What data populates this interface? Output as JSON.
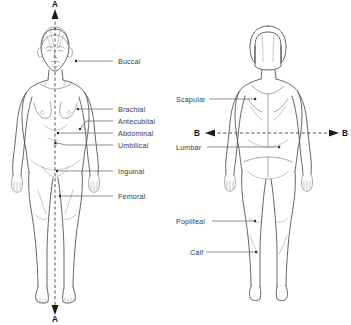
{
  "diagram": {
    "background_color": "#ffffff",
    "line_color": "#4a4a4a",
    "label_color": "#3a3a3a",
    "plane_color": "#2f2f2f"
  },
  "planes": [
    {
      "id": "plane-a",
      "letter_top": "A",
      "letter_bottom": "A",
      "orientation": "vertical",
      "description": "midsagittal plane on anterior figure"
    },
    {
      "id": "plane-b",
      "letter_left": "B",
      "letter_right": "B",
      "orientation": "horizontal",
      "description": "transverse plane on posterior figure"
    }
  ],
  "anterior": {
    "view_name": "anterior-view",
    "labels": [
      {
        "text": "Buccal",
        "x": 118,
        "y": 64,
        "line_x1": 113,
        "line_x2": 78,
        "dot_x": 76,
        "dot_y": 61
      },
      {
        "text": "Brachial",
        "x": 118,
        "y": 112,
        "line_x1": 113,
        "line_x2": 80,
        "dot_x": 78,
        "dot_y": 109
      },
      {
        "text": "Antecubital",
        "x": 118,
        "y": 124,
        "line_x1": 113,
        "line_x2": 82,
        "dot_x": 80,
        "dot_y": 128
      },
      {
        "text": "Abdominal",
        "x": 118,
        "y": 136,
        "line_x1": 113,
        "line_x2": 60,
        "dot_x": 58,
        "dot_y": 133
      },
      {
        "text": "Umbilical",
        "x": 118,
        "y": 148,
        "line_x1": 113,
        "line_x2": 62,
        "dot_x": 60,
        "dot_y": 143
      },
      {
        "text": "Inguinal",
        "x": 118,
        "y": 174,
        "line_x1": 113,
        "line_x2": 59,
        "dot_x": 57,
        "dot_y": 172
      },
      {
        "text": "Femoral",
        "x": 118,
        "y": 199,
        "line_x1": 113,
        "line_x2": 62,
        "dot_x": 60,
        "dot_y": 196
      }
    ]
  },
  "posterior": {
    "view_name": "posterior-view",
    "labels": [
      {
        "text": "Scapular",
        "x": 176,
        "y": 101,
        "line_x1": 209,
        "line_x2": 253,
        "dot_x": 255,
        "dot_y": 99,
        "align": "start",
        "label_right": 207
      },
      {
        "text": "Lumbar",
        "x": 176,
        "y": 149,
        "line_x1": 207,
        "line_x2": 277,
        "dot_x": 279,
        "dot_y": 147,
        "align": "start",
        "label_right": 205
      },
      {
        "text": "Popliteal",
        "x": 176,
        "y": 223,
        "line_x1": 212,
        "line_x2": 253,
        "dot_x": 255,
        "dot_y": 221,
        "align": "start",
        "label_right": 210
      },
      {
        "text": "Calf",
        "x": 190,
        "y": 254,
        "line_x1": 206,
        "line_x2": 254,
        "dot_x": 256,
        "dot_y": 252,
        "align": "start",
        "label_right": 204
      }
    ]
  }
}
